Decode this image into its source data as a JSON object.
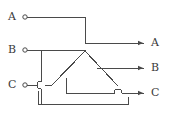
{
  "figure": {
    "type": "wire-crossing-circuit-diagram",
    "background_color": "#ffffff",
    "line_color": "#4a4a4a",
    "label_color": "#3a3a3a",
    "line_width": 1
  },
  "inputs": [
    {
      "id": "in-a",
      "label": "A",
      "terminal": "open-circle",
      "x": 23,
      "y": 17
    },
    {
      "id": "in-b",
      "label": "B",
      "terminal": "open-circle",
      "x": 23,
      "y": 50
    },
    {
      "id": "in-c",
      "label": "C",
      "terminal": "open-circle",
      "x": 23,
      "y": 85
    }
  ],
  "outputs": [
    {
      "id": "out-a",
      "label": "A",
      "terminal": "arrow",
      "x": 147,
      "y": 43
    },
    {
      "id": "out-b",
      "label": "B",
      "terminal": "arrow",
      "x": 147,
      "y": 68
    },
    {
      "id": "out-c",
      "label": "C",
      "terminal": "arrow",
      "x": 147,
      "y": 93
    }
  ],
  "wires": {
    "a_path": "M27,17 L85,17 L85,43 L143,43",
    "b_path": "M27,50 L85,50",
    "b_diagonal": "M85,52 L118,85",
    "b_out_stub": "M88,68 L143,68",
    "c_in_path": "M27,85 L38,85",
    "c_hop_exit": "M45,85 L51,86",
    "left_diagonal": "M85,52 L51,86",
    "b_branch_vertical": "M41,50 L41,78",
    "b_branch_vertical_lower": "M41,91 L41,104",
    "bottom_rail": "M38,104 L128,104",
    "bottom_rail_left_riser": "M38,104 L38,91",
    "u_shape": "M66,78 L66,93 L115,93",
    "right_riser": "M128,104 L128,96",
    "c_out_stub": "M121,93 L143,93",
    "vertex": {
      "x": 85,
      "y": 52
    }
  },
  "hops": [
    {
      "id": "hop-c-over-b-branch",
      "cx": 41,
      "cy": 85,
      "r": 4,
      "orientation": "vertical-bump-left"
    },
    {
      "id": "hop-c-out-over-riser",
      "cx": 118,
      "cy": 93,
      "r": 4,
      "orientation": "vertical-bump-up"
    }
  ]
}
